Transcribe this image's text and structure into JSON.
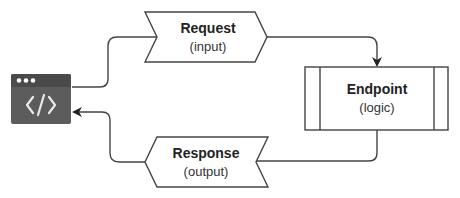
{
  "diagram": {
    "client": {
      "icon": "browser-code-icon",
      "glyph": "</>"
    },
    "request": {
      "title": "Request",
      "subtitle": "(input)"
    },
    "endpoint": {
      "title": "Endpoint",
      "subtitle": "(logic)"
    },
    "response": {
      "title": "Response",
      "subtitle": "(output)"
    },
    "edges": [
      {
        "from": "client",
        "to": "request"
      },
      {
        "from": "request",
        "to": "endpoint"
      },
      {
        "from": "endpoint",
        "to": "response"
      },
      {
        "from": "response",
        "to": "client"
      }
    ],
    "colors": {
      "stroke": "#444444",
      "icon_header": "#4a4a4a",
      "icon_body": "#5c5c5c",
      "icon_glyph": "#e8e8e8"
    }
  }
}
